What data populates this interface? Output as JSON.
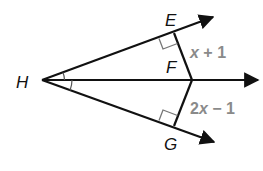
{
  "diagram": {
    "type": "angle-bisector",
    "points": {
      "H": {
        "label": "H",
        "x": 42,
        "y": 80
      },
      "E": {
        "label": "E",
        "x": 174,
        "y": 33
      },
      "F": {
        "label": "F",
        "x": 192,
        "y": 80
      },
      "G": {
        "label": "G",
        "x": 174,
        "y": 126
      }
    },
    "rays": [
      {
        "from": "H",
        "through": "E",
        "arrow": true
      },
      {
        "from": "H",
        "through": "F",
        "arrow": true
      },
      {
        "from": "H",
        "through": "G",
        "arrow": true
      }
    ],
    "segments": [
      {
        "from": "E",
        "to": "F",
        "length_label": "x + 1"
      },
      {
        "from": "G",
        "to": "F",
        "length_label": "2x − 1"
      }
    ],
    "right_angle_marks": [
      "E",
      "G"
    ],
    "congruent_angle_marks": [
      "EHF",
      "FHG"
    ],
    "labels": {
      "H": "H",
      "E": "E",
      "F": "F",
      "G": "G",
      "ef_length": {
        "var": "x",
        "rest": " + 1"
      },
      "gf_length": {
        "coef": "2",
        "var": "x",
        "rest": " − 1"
      }
    },
    "colors": {
      "lines": "#111111",
      "point_labels": "#111111",
      "length_labels": "#8a8a8a",
      "right_angle_marks": "#777777"
    }
  }
}
